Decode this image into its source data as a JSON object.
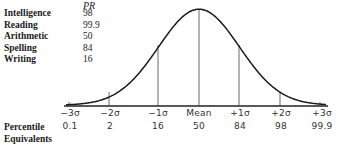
{
  "scores": {
    "header": "PR",
    "rows": [
      {
        "label": "Intelligence",
        "value": "98"
      },
      {
        "label": "Reading",
        "value": "99.9"
      },
      {
        "label": "Arithmetic",
        "value": "50"
      },
      {
        "label": "Spelling",
        "value": "84"
      },
      {
        "label": "Writing",
        "value": "16"
      }
    ]
  },
  "percentile_label": {
    "line1": "Percentile",
    "line2": "Equivalents"
  },
  "axis": {
    "sigma_labels": [
      "−3σ",
      "−2σ",
      "−1σ",
      "Mean",
      "+1σ",
      "+2σ",
      "+3σ"
    ],
    "percentiles": [
      "0.1",
      "2",
      "16",
      "50",
      "84",
      "98",
      "99.9"
    ]
  },
  "chart_data": {
    "type": "line",
    "title": "",
    "x": [
      "−3σ",
      "−2σ",
      "−1σ",
      "Mean",
      "+1σ",
      "+2σ",
      "+3σ"
    ],
    "series": [
      {
        "name": "Percentile Equivalents",
        "values": [
          0.1,
          2,
          16,
          50,
          84,
          98,
          99.9
        ]
      }
    ],
    "annotations": {
      "PR_scores": {
        "Intelligence": 98,
        "Reading": 99.9,
        "Arithmetic": 50,
        "Spelling": 84,
        "Writing": 16
      }
    },
    "xlabel": "Percentile Equivalents",
    "ylabel": "",
    "grid": false,
    "legend": "none"
  }
}
